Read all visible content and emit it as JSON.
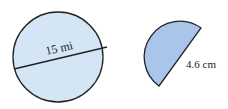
{
  "figures": [
    {
      "shape": "circle",
      "label": "15 mi",
      "measure": "diameter",
      "fill": "#d4e6f5",
      "stroke": "#222222"
    },
    {
      "shape": "semicircle",
      "label": "4.6 cm",
      "measure": "diameter",
      "fill": "#a9c6ea",
      "stroke": "#222222"
    }
  ]
}
